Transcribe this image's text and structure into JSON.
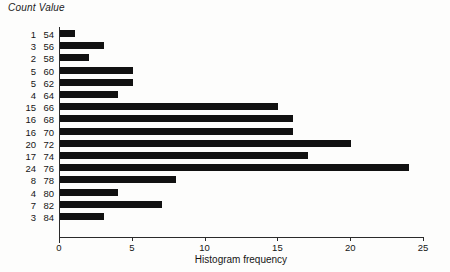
{
  "header": {
    "count_label": "Count",
    "value_label": "Value",
    "combined": "Count Value"
  },
  "chart_data": {
    "type": "bar",
    "orientation": "horizontal",
    "title": "",
    "xlabel": "Histogram frequency",
    "ylabel": "",
    "xlim": [
      0,
      25
    ],
    "xticks": [
      0,
      5,
      10,
      15,
      20,
      25
    ],
    "xtick_labels": [
      "0",
      "5",
      "10",
      "15",
      "20",
      "25"
    ],
    "grid": false,
    "legend": null,
    "bar_color": "#111111",
    "axis_color": "#2a2a2a",
    "categories": [
      "54",
      "56",
      "58",
      "60",
      "62",
      "64",
      "66",
      "68",
      "70",
      "72",
      "74",
      "76",
      "78",
      "80",
      "82",
      "84"
    ],
    "values": [
      1,
      3,
      2,
      5,
      5,
      4,
      15,
      16,
      16,
      20,
      17,
      24,
      8,
      4,
      7,
      3
    ],
    "rows": [
      {
        "count": "1",
        "value": "54",
        "n": 1
      },
      {
        "count": "3",
        "value": "56",
        "n": 3
      },
      {
        "count": "2",
        "value": "58",
        "n": 2
      },
      {
        "count": "5",
        "value": "60",
        "n": 5
      },
      {
        "count": "5",
        "value": "62",
        "n": 5
      },
      {
        "count": "4",
        "value": "64",
        "n": 4
      },
      {
        "count": "15",
        "value": "66",
        "n": 15
      },
      {
        "count": "16",
        "value": "68",
        "n": 16
      },
      {
        "count": "16",
        "value": "70",
        "n": 16
      },
      {
        "count": "20",
        "value": "72",
        "n": 20
      },
      {
        "count": "17",
        "value": "74",
        "n": 17
      },
      {
        "count": "24",
        "value": "76",
        "n": 24
      },
      {
        "count": "8",
        "value": "78",
        "n": 8
      },
      {
        "count": "4",
        "value": "80",
        "n": 4
      },
      {
        "count": "7",
        "value": "82",
        "n": 7
      },
      {
        "count": "3",
        "value": "84",
        "n": 3
      }
    ]
  }
}
